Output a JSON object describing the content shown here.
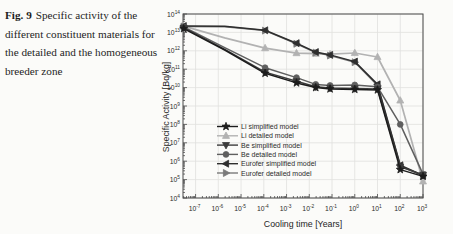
{
  "figure": {
    "caption_label": "Fig. 9",
    "caption_text": "Specific activity of the different constituent materials for the detailed and the homogeneous breeder zone"
  },
  "chart_data": {
    "type": "line",
    "title": "",
    "xlabel": "Cooling time [Years]",
    "ylabel": "Specific Activity [Bq/kg]",
    "x_scale": "log",
    "y_scale": "log",
    "xlim": [
      2.8e-08,
      1000
    ],
    "ylim": [
      10000.0,
      100000000000000.0
    ],
    "x_tick_exponents": [
      -7,
      -6,
      -5,
      -4,
      -3,
      -2,
      -1,
      0,
      1,
      2,
      3
    ],
    "y_tick_exponents": [
      4,
      5,
      6,
      7,
      8,
      9,
      10,
      11,
      12,
      13,
      14
    ],
    "grid": true,
    "legend_position": "inside lower-left",
    "x": [
      3e-08,
      1.9e-06,
      0.000114,
      0.00274,
      0.0192,
      0.082,
      1,
      10,
      100,
      1000
    ],
    "series": [
      {
        "name": "Li simplified model",
        "marker": "star",
        "color": "#1c1c1c",
        "values": [
          16000000000000.0,
          1100000000000.0,
          60000000000.0,
          18000000000.0,
          10000000000.0,
          8500000000.0,
          8000000000.0,
          7500000000.0,
          350000.0,
          150000.0
        ]
      },
      {
        "name": "Li detailed model",
        "marker": "triangle-up",
        "color": "#b2b2b2",
        "values": [
          22000000000000.0,
          5000000000000.0,
          1400000000000.0,
          750000000000.0,
          700000000000.0,
          650000000000.0,
          760000000000.0,
          460000000000.0,
          2000000000.0,
          80000.0
        ]
      },
      {
        "name": "Be simplified model",
        "marker": "triangle-down",
        "color": "#3c3c3c",
        "values": [
          18000000000000.0,
          1200000000000.0,
          70000000000.0,
          22000000000.0,
          11000000000.0,
          9500000000.0,
          9000000000.0,
          8500000000.0,
          500000.0,
          180000.0
        ]
      },
      {
        "name": "Be detailed model",
        "marker": "circle",
        "color": "#5f5f5f",
        "values": [
          20000000000000.0,
          1500000000000.0,
          120000000000.0,
          35000000000.0,
          15000000000.0,
          13000000000.0,
          14000000000.0,
          11000000000.0,
          100000000.0,
          200000.0
        ]
      },
      {
        "name": "Eurofer simplified model",
        "marker": "triangle-left",
        "color": "#2e2e2e",
        "values": [
          22000000000000.0,
          21500000000000.0,
          13000000000000.0,
          2600000000000.0,
          850000000000.0,
          600000000000.0,
          260000000000.0,
          15000000000.0,
          600000.0,
          170000.0
        ]
      },
      {
        "name": "Eurofer detailed model",
        "marker": "triangle-right",
        "color": "#7a7a7a",
        "values": [
          21000000000000.0,
          20500000000000.0,
          12500000000000.0,
          2400000000000.0,
          800000000000.0,
          550000000000.0,
          240000000000.0,
          13000000000.0,
          550000.0,
          160000.0
        ]
      }
    ]
  }
}
